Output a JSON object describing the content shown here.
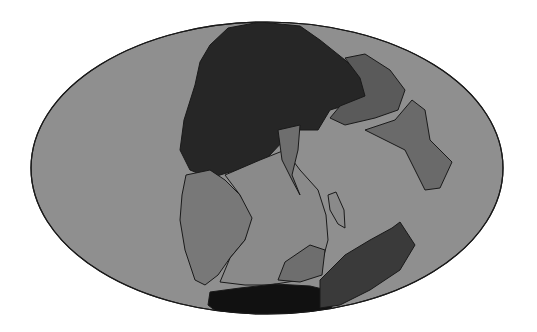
{
  "map": {
    "projection": "ellipse (Mollweide-style world map)",
    "colors": {
      "ocean": "#8f8f8f",
      "outline": "#1a1a1a",
      "north_landmass": "#262626",
      "east_block": "#5a5a5a",
      "east_island": "#6a6a6a",
      "south_america": "#787878",
      "africa": "#8a8a8a",
      "antarctica": "#111111",
      "australia_india": "#3a3a3a",
      "background": "#ffffff"
    },
    "regions": [
      "Laurasia (north landmass)",
      "Asia-east block",
      "Cimmerian island",
      "South America",
      "Africa",
      "Madagascar strip",
      "Antarctica",
      "Australia"
    ]
  }
}
